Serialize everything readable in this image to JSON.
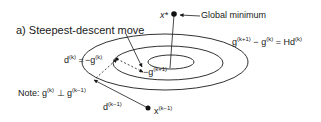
{
  "title": "a) Steepest-descent move",
  "labels": {
    "global_min": "Global minimum",
    "x_star": "x*",
    "equation": {
      "lhs_base": "g",
      "lhs_sup": "(k+1)",
      "minus": " − ",
      "mid_base": "g",
      "mid_sup": "(k)",
      "eq": " = Hd",
      "rhs_sup": "(k)"
    },
    "d_k": {
      "base": "d",
      "sup": "(k)",
      "eq": " = "
    },
    "neg_g_k": {
      "base": "−g",
      "sup": "(k)"
    },
    "neg_g_k1": {
      "base": "−g",
      "sup": "(k+1)"
    },
    "note": {
      "prefix": "Note: g",
      "sup1": "(k)",
      "perp": " ⊥ g",
      "sup2": "(k−1)"
    },
    "d_k_minus1": {
      "base": "d",
      "sup": "(k−1)"
    },
    "x_k_minus1": {
      "base": "x",
      "sup": "(k−1)"
    }
  },
  "contours": [
    {
      "name": "outer",
      "cx": 165,
      "cy": 62,
      "rx": 83,
      "ry": 28
    },
    {
      "name": "middle",
      "cx": 168,
      "cy": 63,
      "rx": 55,
      "ry": 17
    },
    {
      "name": "inner",
      "cx": 171,
      "cy": 62,
      "rx": 23,
      "ry": 7
    }
  ],
  "colors": {
    "stroke": "#1a1a1a",
    "background": "#ffffff"
  }
}
